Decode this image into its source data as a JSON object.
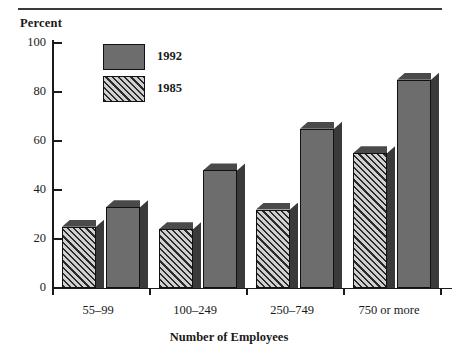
{
  "chart_data": {
    "type": "bar",
    "title": "",
    "ylabel": "Percent",
    "xlabel": "Number of Employees",
    "categories": [
      "55–99",
      "100–249",
      "250–749",
      "750 or more"
    ],
    "series": [
      {
        "name": "1992",
        "values": [
          33,
          48,
          65,
          85
        ],
        "fill": "solid",
        "color": "#6d6d6d"
      },
      {
        "name": "1985",
        "values": [
          25,
          24,
          32,
          55
        ],
        "fill": "diagonal-hatch",
        "color": "#2a2a2a"
      }
    ],
    "series_draw_order": [
      "1985",
      "1992"
    ],
    "ylim": [
      0,
      100
    ],
    "yticks": [
      0,
      20,
      40,
      60,
      80,
      100
    ],
    "ytick_labels": [
      "0",
      "20",
      "40",
      "60",
      "80",
      "100"
    ],
    "grid": false,
    "legend_position": "upper-left-inside",
    "style": "3d-bars-monochrome"
  },
  "axes": {
    "y_axis_title": "Percent",
    "x_axis_title": "Number of Employees"
  },
  "legend": {
    "entries": [
      {
        "label": "1992",
        "swatch": "solid"
      },
      {
        "label": "1985",
        "swatch": "hatched"
      }
    ]
  },
  "ticks": {
    "y": [
      {
        "label": "100",
        "value": 100
      },
      {
        "label": "80",
        "value": 80
      },
      {
        "label": "60",
        "value": 60
      },
      {
        "label": "40",
        "value": 40
      },
      {
        "label": "20",
        "value": 20
      },
      {
        "label": "0",
        "value": 0
      }
    ],
    "x": [
      {
        "label": "55–99"
      },
      {
        "label": "100–249"
      },
      {
        "label": "250–749"
      },
      {
        "label": "750 or more"
      }
    ]
  },
  "colors": {
    "ink": "#1a1a1a",
    "rule": "#3b3b3b",
    "bar_1992_face": "#6d6d6d",
    "bar_top": "#4a4a4a",
    "bar_side": "#3a3a3a",
    "hatch_line": "#2a2a2a",
    "hatch_bg": "#cfcfcf",
    "background": "#ffffff"
  }
}
